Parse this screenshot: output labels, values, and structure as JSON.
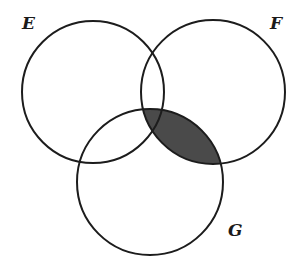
{
  "diagram": {
    "type": "venn",
    "background": "#ffffff",
    "stroke_color": "#1c1c1c",
    "shade_color": "#4a4a4a",
    "sets": [
      {
        "id": "E",
        "label": "E",
        "cx": 93,
        "cy": 92,
        "r": 71,
        "label_x": 22,
        "label_y": 29
      },
      {
        "id": "F",
        "label": "F",
        "cx": 213,
        "cy": 92,
        "r": 72,
        "label_x": 270,
        "label_y": 29
      },
      {
        "id": "G",
        "label": "G",
        "cx": 150,
        "cy": 182,
        "r": 73,
        "label_x": 228,
        "label_y": 236
      }
    ],
    "shaded_region": {
      "description": "F ∩ G",
      "sets": [
        "F",
        "G"
      ]
    }
  }
}
